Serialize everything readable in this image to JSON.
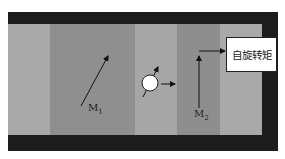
{
  "diagram": {
    "layers": [
      {
        "name": "left-lead",
        "x": 8,
        "width": 42,
        "color": "#a9a9a9"
      },
      {
        "name": "free-layer-m1",
        "x": 50,
        "width": 85,
        "color": "#8f8f8f"
      },
      {
        "name": "spacer",
        "x": 135,
        "width": 42,
        "color": "#a6a6a6"
      },
      {
        "name": "fixed-layer-m2",
        "x": 177,
        "width": 43,
        "color": "#8e8e8e"
      },
      {
        "name": "right-lead",
        "x": 220,
        "width": 42,
        "color": "#a9a9a9"
      }
    ],
    "labels": {
      "m1_main": "M",
      "m1_sub": "1",
      "m2_main": "M",
      "m2_sub": "2",
      "torque": "自旋转矩"
    },
    "colors": {
      "frame": "#1c1c1c",
      "arrow": "#111111",
      "electron": "#ffffff"
    }
  }
}
